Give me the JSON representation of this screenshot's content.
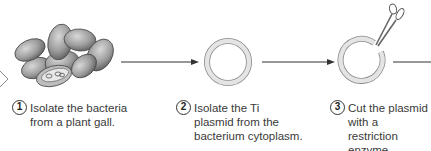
{
  "diagram": {
    "type": "process-flow",
    "colors": {
      "line": "#333333",
      "ring_fill": "#e4e4e4",
      "ring_stroke": "#8a8a8a",
      "bacteria": "#9a9a9a"
    },
    "steps": [
      {
        "number": "1",
        "lines": [
          "Isolate the bacteria",
          "from a plant gall."
        ],
        "icon": "bacteria-cluster-icon"
      },
      {
        "number": "2",
        "lines": [
          "Isolate the Ti",
          "plasmid from the",
          "bacterium cytoplasm."
        ],
        "icon": "plasmid-ring-icon"
      },
      {
        "number": "3",
        "lines": [
          "Cut the plasmid",
          "with a restriction",
          "enzyme."
        ],
        "icon": "cut-plasmid-scissors-icon"
      }
    ]
  }
}
